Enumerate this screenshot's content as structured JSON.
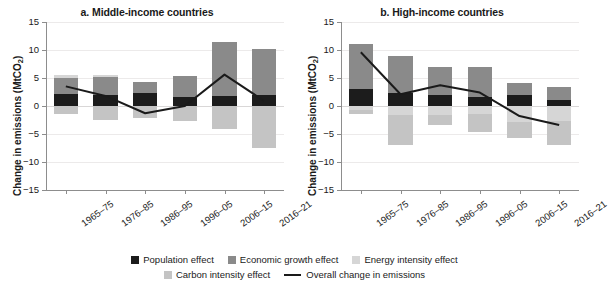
{
  "figure": {
    "ylabel_main": "Change in emissions (MtCO",
    "ylabel_sub": "2",
    "ylabel_close": ")"
  },
  "legend": {
    "items": [
      {
        "name": "population-effect",
        "label": "Population effect",
        "color": "#1c1c1c",
        "type": "swatch"
      },
      {
        "name": "economic-growth-effect",
        "label": "Economic growth effect",
        "color": "#8a8a8a",
        "type": "swatch"
      },
      {
        "name": "energy-intensity-effect",
        "label": "Energy intensity effect",
        "color": "#d6d6d6",
        "type": "swatch"
      },
      {
        "name": "carbon-intensity-effect",
        "label": "Carbon intensity effect",
        "color": "#c4c4c4",
        "type": "swatch"
      },
      {
        "name": "overall-change-in-emissions",
        "label": "Overall change in emissions",
        "color": "#1a1a1a",
        "type": "line"
      }
    ]
  },
  "chart_data": [
    {
      "type": "bar",
      "panel": "a",
      "title": "a. Middle-income countries",
      "xlabel": "",
      "ylabel": "Change in emissions (MtCO2)",
      "ylim": [
        -15,
        15
      ],
      "yticks": [
        15,
        10,
        5,
        0,
        -5,
        -10,
        -15
      ],
      "ytick_labels": [
        "15",
        "10",
        "5",
        "0",
        "−5",
        "−10",
        "−15"
      ],
      "grid": true,
      "stacked": true,
      "legend_position": "bottom",
      "categories": [
        "1965–75",
        "1976–85",
        "1986–95",
        "1996–05",
        "2006–15",
        "2016–21"
      ],
      "series": [
        {
          "name": "Population effect",
          "color": "#1c1c1c",
          "values": [
            2.1,
            2.0,
            2.3,
            1.6,
            1.7,
            2.0
          ]
        },
        {
          "name": "Economic growth effect",
          "color": "#8a8a8a",
          "values": [
            2.9,
            3.1,
            1.9,
            3.8,
            9.7,
            8.2
          ]
        },
        {
          "name": "Energy intensity effect",
          "color": "#d6d6d6",
          "values": [
            0.6,
            0.5,
            0.0,
            0.0,
            0.0,
            0.0
          ]
        },
        {
          "name": "Carbon intensity effect",
          "color": "#c4c4c4",
          "values": [
            -1.5,
            -2.5,
            -2.1,
            -2.7,
            -4.1,
            -7.5
          ]
        }
      ],
      "line": {
        "name": "Overall change in emissions",
        "color": "#1a1a1a",
        "values": [
          3.5,
          1.8,
          -1.3,
          0.0,
          5.6,
          0.9
        ]
      }
    },
    {
      "type": "bar",
      "panel": "b",
      "title": "b. High-income countries",
      "xlabel": "",
      "ylabel": "Change in emissions (MtCO2)",
      "ylim": [
        -15,
        15
      ],
      "yticks": [
        15,
        10,
        5,
        0,
        -5,
        -10,
        -15
      ],
      "ytick_labels": [
        "15",
        "10",
        "5",
        "0",
        "−5",
        "−10",
        "−15"
      ],
      "grid": true,
      "stacked": true,
      "legend_position": "bottom",
      "categories": [
        "1965–75",
        "1976–85",
        "1986–95",
        "1996–05",
        "2006–15",
        "2016–21"
      ],
      "series": [
        {
          "name": "Population effect",
          "color": "#1c1c1c",
          "values": [
            3.1,
            2.4,
            2.0,
            1.6,
            2.0,
            1.1
          ]
        },
        {
          "name": "Economic growth effect",
          "color": "#8a8a8a",
          "values": [
            8.0,
            6.6,
            5.0,
            5.3,
            2.1,
            2.3
          ]
        },
        {
          "name": "Energy intensity effect",
          "color": "#d6d6d6",
          "values": [
            -0.8,
            -1.6,
            -1.6,
            -1.5,
            -2.9,
            -2.6
          ]
        },
        {
          "name": "Carbon intensity effect",
          "color": "#c4c4c4",
          "values": [
            -0.7,
            -5.4,
            -1.8,
            -3.1,
            -2.9,
            -4.3
          ]
        }
      ],
      "line": {
        "name": "Overall change in emissions",
        "color": "#1a1a1a",
        "values": [
          9.6,
          2.1,
          3.7,
          2.4,
          -1.8,
          -3.4
        ]
      }
    }
  ]
}
